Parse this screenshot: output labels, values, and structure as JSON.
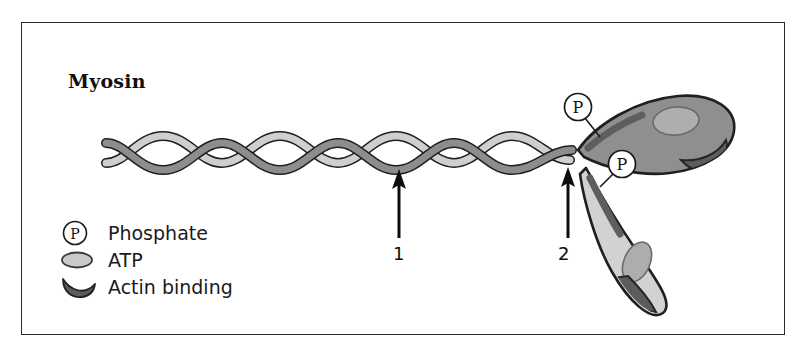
{
  "figure": {
    "title": "Myosin",
    "border_color": "#2b2b2b",
    "background": "#ffffff"
  },
  "colors": {
    "dark_strand": "#8a8a8a",
    "light_strand": "#c8c8c8",
    "head_upper_fill": "#8f8f8f",
    "head_lower_fill": "#d2d2d2",
    "atp_site_upper": "#a8a8a8",
    "atp_site_lower": "#adadad",
    "actin_binding": "#5c5c5c",
    "phosphate_band": "#5e5e5e",
    "outline": "#1f1f1f",
    "text": "#101010"
  },
  "callouts": [
    {
      "id": "phosphate-upper",
      "label": "P",
      "icon": "circled-p-icon",
      "circle": {
        "cx": 578,
        "cy": 107,
        "r": 13
      },
      "leader": {
        "x1": 586,
        "y1": 118,
        "x2": 601,
        "y2": 135
      }
    },
    {
      "id": "phosphate-lower",
      "label": "P",
      "icon": "circled-p-icon",
      "circle": {
        "cx": 622,
        "cy": 165,
        "r": 13
      },
      "leader": {
        "x1": 612,
        "y1": 174,
        "x2": 600,
        "y2": 186
      }
    }
  ],
  "arrows": [
    {
      "id": "arrow-1",
      "label": "1",
      "x": 399,
      "tip_y": 170,
      "tail_y": 238,
      "points_to": "coiled-coil-tail"
    },
    {
      "id": "arrow-2",
      "label": "2",
      "x": 568,
      "tip_y": 168,
      "tail_y": 238,
      "points_to": "neck-hinge-region"
    }
  ],
  "legend": {
    "items": [
      {
        "label": "Phosphate",
        "icon": "circled-p-icon",
        "swatch_type": "circle-p"
      },
      {
        "label": "ATP",
        "icon": "atp-ellipse-icon",
        "swatch_type": "ellipse"
      },
      {
        "label": "Actin binding",
        "icon": "actin-crescent-icon",
        "swatch_type": "crescent"
      }
    ]
  },
  "structures": {
    "tail": {
      "name": "coiled-coil-tail",
      "description": "double-helix coiled coil",
      "crossings": 8
    },
    "heads": [
      {
        "name": "myosin-head-upper",
        "shade": "dark",
        "has_atp_site": true,
        "has_actin_binding_site": true,
        "has_phosphate_band": true
      },
      {
        "name": "myosin-head-lower",
        "shade": "light",
        "has_atp_site": true,
        "has_actin_binding_site": true,
        "has_phosphate_band": true
      }
    ]
  }
}
